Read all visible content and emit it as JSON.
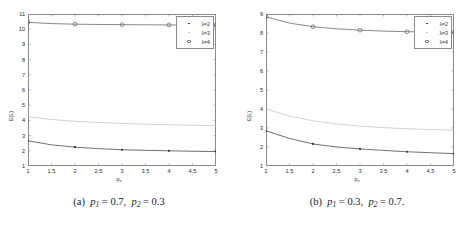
{
  "figure": {
    "panels": [
      {
        "id": "panel-a",
        "caption_prefix": "(a)",
        "caption_p1": "0.7",
        "caption_p2": "0.3",
        "caption_tail": "",
        "chart_data": {
          "type": "line",
          "title": "",
          "xlabel": "p_v",
          "ylabel": "E(L)",
          "xlim": [
            1,
            5
          ],
          "ylim": [
            1,
            11
          ],
          "xticks": [
            "1",
            "1.5",
            "2",
            "2.5",
            "3",
            "3.5",
            "4",
            "4.5",
            "5"
          ],
          "xtick_values": [
            1,
            1.5,
            2,
            2.5,
            3,
            3.5,
            4,
            4.5,
            5
          ],
          "yticks": [
            "1",
            "2",
            "3",
            "4",
            "5",
            "6",
            "7",
            "8",
            "9",
            "10",
            "11"
          ],
          "ytick_values": [
            1,
            2,
            3,
            4,
            5,
            6,
            7,
            8,
            9,
            10,
            11
          ],
          "grid": false,
          "legend_position": "top-right",
          "x": [
            1,
            1.5,
            2,
            2.5,
            3,
            3.5,
            4,
            4.5,
            5
          ],
          "series": [
            {
              "name": "λ=2",
              "marker": "dot",
              "color": "#333333",
              "marker_x": [
                1,
                2,
                3,
                4,
                5
              ],
              "marker_y": [
                2.66,
                2.24,
                2.07,
                2.0,
                1.95
              ],
              "values": [
                2.66,
                2.39,
                2.24,
                2.14,
                2.07,
                2.03,
                2.0,
                1.97,
                1.95
              ]
            },
            {
              "name": "λ=3",
              "marker": "none",
              "color": "#bdbdbd",
              "marker_x": [],
              "marker_y": [],
              "values": [
                4.25,
                4.06,
                3.94,
                3.86,
                3.8,
                3.75,
                3.71,
                3.68,
                3.65
              ]
            },
            {
              "name": "λ=4",
              "marker": "circle",
              "color": "#555555",
              "marker_x": [
                1,
                2,
                3,
                4,
                5
              ],
              "marker_y": [
                10.45,
                10.33,
                10.3,
                10.28,
                10.27
              ],
              "values": [
                10.45,
                10.37,
                10.33,
                10.31,
                10.3,
                10.29,
                10.28,
                10.275,
                10.27
              ]
            }
          ]
        }
      },
      {
        "id": "panel-b",
        "caption_prefix": "(b)",
        "caption_p1": "0.3",
        "caption_p2": "0.7",
        "caption_tail": ".",
        "chart_data": {
          "type": "line",
          "title": "",
          "xlabel": "p_v",
          "ylabel": "E(L)",
          "xlim": [
            1,
            5
          ],
          "ylim": [
            1,
            9
          ],
          "xticks": [
            "1",
            "1.5",
            "2",
            "2.5",
            "3",
            "3.5",
            "4",
            "4.5",
            "5"
          ],
          "xtick_values": [
            1,
            1.5,
            2,
            2.5,
            3,
            3.5,
            4,
            4.5,
            5
          ],
          "yticks": [
            "1",
            "2",
            "3",
            "4",
            "5",
            "6",
            "7",
            "8",
            "9"
          ],
          "ytick_values": [
            1,
            2,
            3,
            4,
            5,
            6,
            7,
            8,
            9
          ],
          "grid": false,
          "legend_position": "top-right",
          "x": [
            1,
            1.5,
            2,
            2.5,
            3,
            3.5,
            4,
            4.5,
            5
          ],
          "series": [
            {
              "name": "λ=2",
              "marker": "dot",
              "color": "#333333",
              "marker_x": [
                1,
                2,
                3,
                4,
                5
              ],
              "marker_y": [
                2.85,
                2.16,
                1.9,
                1.75,
                1.65
              ],
              "values": [
                2.85,
                2.45,
                2.16,
                2.0,
                1.9,
                1.82,
                1.75,
                1.7,
                1.65
              ]
            },
            {
              "name": "λ=3",
              "marker": "none",
              "color": "#bdbdbd",
              "marker_x": [],
              "marker_y": [],
              "values": [
                4.0,
                3.63,
                3.38,
                3.21,
                3.1,
                3.02,
                2.96,
                2.92,
                2.88
              ]
            },
            {
              "name": "λ=4",
              "marker": "circle",
              "color": "#555555",
              "marker_x": [
                1,
                2,
                3,
                4,
                5
              ],
              "marker_y": [
                8.85,
                8.33,
                8.15,
                8.07,
                8.03
              ],
              "values": [
                8.85,
                8.52,
                8.33,
                8.22,
                8.15,
                8.1,
                8.07,
                8.05,
                8.03
              ]
            }
          ]
        }
      }
    ],
    "legend_entries": [
      "λ=2",
      "λ=3",
      "λ=4"
    ],
    "caption_var": "p",
    "caption_eq": "=",
    "caption_sep": ", "
  }
}
